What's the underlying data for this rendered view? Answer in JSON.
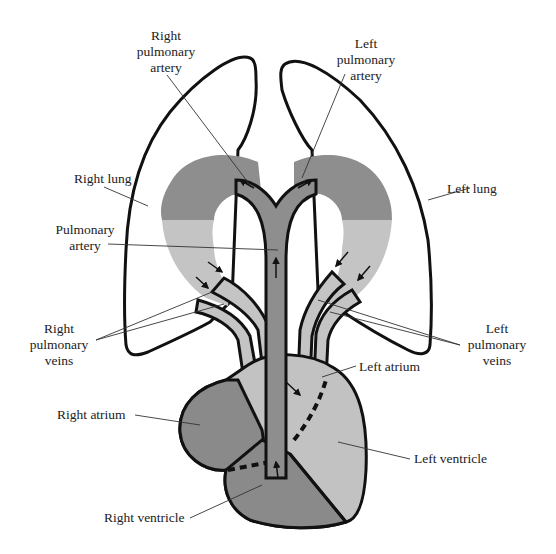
{
  "diagram": {
    "colors": {
      "deoxygenated": "#8e8e8e",
      "oxygenated": "#c4c4c4",
      "heart_dark": "#8a8a8a",
      "heart_light": "#c2c2c2",
      "outline": "#111111",
      "leader": "#333333"
    },
    "labels": {
      "right_pulmonary_artery": [
        "Right",
        "pulmonary",
        "artery"
      ],
      "left_pulmonary_artery": [
        "Left",
        "pulmonary",
        "artery"
      ],
      "right_lung": "Right lung",
      "left_lung": "Left lung",
      "pulmonary_artery": [
        "Pulmonary",
        "artery"
      ],
      "right_pulmonary_veins": [
        "Right",
        "pulmonary",
        "veins"
      ],
      "left_pulmonary_veins": [
        "Left",
        "pulmonary",
        "veins"
      ],
      "left_atrium": "Left atrium",
      "right_atrium": "Right atrium",
      "left_ventricle": "Left ventricle",
      "right_ventricle": "Right ventricle"
    }
  }
}
